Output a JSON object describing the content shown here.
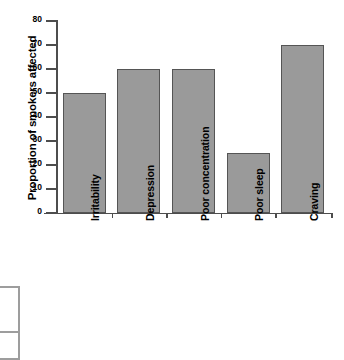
{
  "chart_data": {
    "type": "bar",
    "title": "",
    "xlabel": "",
    "ylabel": "Proportion of smokers affected",
    "categories": [
      "Irritability",
      "Depression",
      "Poor concentration",
      "Poor sleep",
      "Craving"
    ],
    "values": [
      50,
      60,
      60,
      25,
      70
    ],
    "ylim": [
      0,
      80
    ],
    "yticks": [
      0,
      10,
      20,
      30,
      40,
      50,
      60,
      70,
      80
    ],
    "ytick_labels": [
      "0",
      "10",
      "20",
      "30",
      "40",
      "50",
      "60",
      "70",
      "80"
    ],
    "grid": false,
    "legend": null,
    "colors": {
      "bar_fill": "#9a9a9a",
      "bar_border": "#555555",
      "axis": "#4d4d4d",
      "text": "#000000",
      "background": "#ffffff"
    }
  },
  "fragment": {
    "name": "clipped-table-box"
  }
}
